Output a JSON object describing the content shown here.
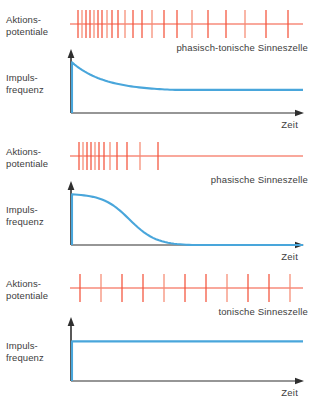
{
  "figure": {
    "colors": {
      "spike": "#f4533a",
      "spike_light": "#f58a72",
      "curve": "#49a6db",
      "axis": "#2f2f2f",
      "text": "#3d3d3d",
      "background": "#ffffff"
    },
    "labels": {
      "spike_row": "Aktions-\npotentiale",
      "frequency_row": "Impuls-\nfrequenz",
      "time_axis": "Zeit"
    }
  },
  "panels": [
    {
      "id": "phasisch-tonisch",
      "caption": "phasisch-tonische Sinneszelle",
      "spike_baseline_y": 24,
      "spike_half_height": 14,
      "spike_positions": [
        78,
        82,
        86,
        90,
        94,
        98,
        102,
        107,
        112,
        118,
        125,
        133,
        142,
        152,
        164,
        177,
        192,
        208,
        226,
        245,
        266,
        288
      ],
      "curve": {
        "kind": "phasic-tonic",
        "description": "Sprung auf Maximum, Abfall auf konstantes Plateau",
        "onset_x": 72,
        "peak_y": 0.92,
        "plateau_y": 0.42,
        "decay_end_x": 175,
        "end_x": 303
      }
    },
    {
      "id": "phasisch",
      "caption": "phasische Sinneszelle",
      "spike_baseline_y": 24,
      "spike_half_height": 14,
      "spike_positions": [
        79,
        83,
        87,
        91,
        95,
        99,
        104,
        110,
        117,
        127,
        140,
        158
      ],
      "curve": {
        "kind": "phasic",
        "description": "Sprung auf Maximum, vollstaendiger Abfall auf Null",
        "onset_x": 72,
        "peak_y": 0.92,
        "plateau_y": 0.0,
        "decay_end_x": 192,
        "end_x": 303
      }
    },
    {
      "id": "tonisch",
      "caption": "tonische Sinneszelle",
      "spike_baseline_y": 24,
      "spike_half_height": 14,
      "spike_positions": [
        80,
        101,
        122,
        143,
        164,
        185,
        206,
        227,
        248,
        269,
        290
      ],
      "curve": {
        "kind": "tonic",
        "description": "Sprung auf konstantes Niveau, keine Adaptation",
        "onset_x": 72,
        "peak_y": 0.72,
        "plateau_y": 0.72,
        "decay_end_x": 72,
        "end_x": 303
      }
    }
  ],
  "chart_data": {
    "type": "line",
    "xlabel": "Zeit",
    "ylabel": "Impulsfrequenz",
    "grid": false,
    "legend": "none",
    "series": [
      {
        "name": "phasisch-tonische Sinneszelle",
        "x": [
          0,
          10,
          11,
          14,
          20,
          28,
          36,
          45,
          55,
          70,
          100
        ],
        "values": [
          0,
          0,
          92,
          90,
          78,
          60,
          50,
          45,
          43,
          42,
          42
        ]
      },
      {
        "name": "phasische Sinneszelle",
        "x": [
          0,
          10,
          11,
          18,
          26,
          34,
          42,
          50,
          58,
          66,
          100
        ],
        "values": [
          0,
          0,
          92,
          88,
          78,
          60,
          36,
          14,
          4,
          0,
          0
        ]
      },
      {
        "name": "tonische Sinneszelle",
        "x": [
          0,
          10,
          11,
          30,
          50,
          70,
          100
        ],
        "values": [
          0,
          0,
          72,
          72,
          72,
          72,
          72
        ]
      }
    ],
    "spike_trains": [
      {
        "name": "phasisch-tonische Sinneszelle",
        "count": 22,
        "pattern": "hohe Anfangsfrequenz, Abnahme auf konstante Dauerfrequenz"
      },
      {
        "name": "phasische Sinneszelle",
        "count": 12,
        "pattern": "hohe Anfangsfrequenz, Abnahme bis zum Erloeschen"
      },
      {
        "name": "tonische Sinneszelle",
        "count": 11,
        "pattern": "gleichmaessige Frequenz ueber die gesamte Dauer"
      }
    ]
  }
}
